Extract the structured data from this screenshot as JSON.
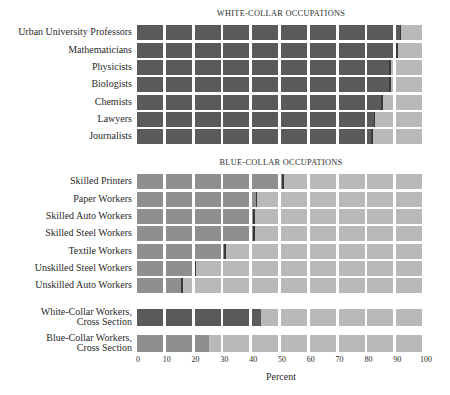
{
  "chart_data": {
    "type": "bar",
    "orientation": "horizontal",
    "stacked_percent": true,
    "xlabel": "Percent",
    "ylabel": "",
    "xlim": [
      0,
      100
    ],
    "x_ticks": [
      "0",
      "10",
      "20",
      "30",
      "40",
      "50",
      "60",
      "70",
      "80",
      "90",
      "100"
    ],
    "grid": "cells every 10 percent",
    "legend": null,
    "panels": [
      {
        "title": "WHITE-COLLAR OCCUPATIONS",
        "categories": [
          "Urban University Professors",
          "Mathematicians",
          "Physicists",
          "Biologists",
          "Chemists",
          "Lawyers",
          "Journalists"
        ],
        "values": [
          92,
          90.5,
          89,
          89,
          86,
          83,
          82
        ]
      },
      {
        "title": "BLUE-COLLAR OCCUPATIONS",
        "categories": [
          "Skilled Printers",
          "Paper Workers",
          "Skilled Auto Workers",
          "Skilled Steel Workers",
          "Textile Workers",
          "Unskilled Steel Workers",
          "Unskilled Auto Workers"
        ],
        "values": [
          51,
          42,
          41,
          41,
          31,
          20.5,
          16.5
        ]
      },
      {
        "title": "",
        "categories": [
          "White-Collar Workers, Cross Section",
          "Blue-Collar Workers, Cross Section"
        ],
        "values": [
          43.5,
          25.5
        ]
      }
    ]
  },
  "colors": {
    "white_collar_fill": "#5a5a5a",
    "blue_collar_fill": "#8f8f8f",
    "remainder": "#b9b9b9",
    "marker_dark": "#3a3a3a",
    "background": "#ffffff"
  },
  "titles": {
    "white_collar": "WHITE-COLLAR OCCUPATIONS",
    "blue_collar": "BLUE-COLLAR OCCUPATIONS"
  },
  "rows": [
    {
      "label": "Urban University Professors",
      "value": 92,
      "group": "wc",
      "top": 25
    },
    {
      "label": "Mathematicians",
      "value": 90.5,
      "group": "wc",
      "top": 42.5
    },
    {
      "label": "Physicists",
      "value": 89,
      "group": "wc",
      "top": 60
    },
    {
      "label": "Biologists",
      "value": 89,
      "group": "wc",
      "top": 77
    },
    {
      "label": "Chemists",
      "value": 86,
      "group": "wc",
      "top": 94.5
    },
    {
      "label": "Lawyers",
      "value": 83,
      "group": "wc",
      "top": 112
    },
    {
      "label": "Journalists",
      "value": 82,
      "group": "wc",
      "top": 129
    },
    {
      "label": "Skilled Printers",
      "value": 51,
      "group": "bc",
      "top": 174
    },
    {
      "label": "Paper Workers",
      "value": 42,
      "group": "bc",
      "top": 191.5
    },
    {
      "label": "Skilled Auto Workers",
      "value": 41,
      "group": "bc",
      "top": 209
    },
    {
      "label": "Skilled Steel Workers",
      "value": 41,
      "group": "bc",
      "top": 226
    },
    {
      "label": "Textile Workers",
      "value": 31,
      "group": "bc",
      "top": 243.5
    },
    {
      "label": "Unskilled Steel Workers",
      "value": 20.5,
      "group": "bc",
      "top": 261
    },
    {
      "label": "Unskilled Auto Workers",
      "value": 16.5,
      "group": "bc",
      "top": 278
    },
    {
      "label": "White-Collar Workers,",
      "label2": "Cross Section",
      "value": 43.5,
      "group": "wc",
      "top": 309,
      "nomarker": true
    },
    {
      "label": "Blue-Collar Workers,",
      "label2": "Cross Section",
      "value": 25.5,
      "group": "bc",
      "top": 335,
      "nomarker": true
    }
  ],
  "axis": {
    "ticks": [
      "0",
      "10",
      "20",
      "30",
      "40",
      "50",
      "60",
      "70",
      "80",
      "90",
      "100"
    ],
    "xlabel": "Percent"
  }
}
